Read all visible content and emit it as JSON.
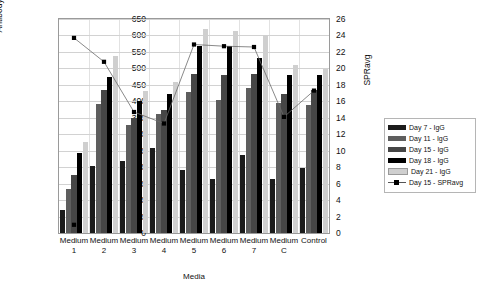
{
  "chart_data": {
    "type": "bar",
    "title": "",
    "xlabel": "Media",
    "ylabel": "Antibody Yield (mg/L)",
    "y2label": "SPRavg",
    "ylim": [
      0,
      650
    ],
    "y2lim": [
      0,
      26
    ],
    "ytick_step": 50,
    "y2tick_step": 2,
    "grid": true,
    "legend_position": "right",
    "categories": [
      "Medium 1",
      "Medium 2",
      "Medium 3",
      "Medium 4",
      "Medium 5",
      "Medium 6",
      "Medium 7",
      "Medium C",
      "Control"
    ],
    "category_lines": [
      [
        "Medium",
        "1"
      ],
      [
        "Medium",
        "2"
      ],
      [
        "Medium",
        "3"
      ],
      [
        "Medium",
        "4"
      ],
      [
        "Medium",
        "5"
      ],
      [
        "Medium",
        "6"
      ],
      [
        "Medium",
        "7"
      ],
      [
        "Medium",
        "C"
      ],
      [
        "Control",
        ""
      ]
    ],
    "yticks": [
      0,
      50,
      100,
      150,
      200,
      250,
      300,
      350,
      400,
      450,
      500,
      550,
      600,
      650
    ],
    "y2ticks": [
      0,
      2,
      4,
      6,
      8,
      10,
      12,
      14,
      16,
      18,
      20,
      22,
      24,
      26
    ],
    "series": [
      {
        "name": "Day 7 - IgG",
        "color": "#1c1c1c",
        "axis": "left",
        "values": [
          70,
          205,
          220,
          257,
          190,
          163,
          236,
          165,
          196
        ]
      },
      {
        "name": "Day 11 - IgG",
        "color": "#5e5e5e",
        "axis": "left",
        "values": [
          135,
          392,
          328,
          360,
          428,
          403,
          441,
          396,
          390
        ]
      },
      {
        "name": "Day 15 - IgG",
        "color": "#464646",
        "axis": "left",
        "values": [
          175,
          434,
          350,
          375,
          482,
          481,
          484,
          421,
          434
        ]
      },
      {
        "name": "Day 18 - IgG",
        "color": "#000000",
        "axis": "left",
        "values": [
          242,
          473,
          400,
          422,
          568,
          567,
          533,
          481,
          479
        ]
      },
      {
        "name": "Day 21 - IgG",
        "color": "#cfcfcf",
        "axis": "left",
        "values": [
          277,
          537,
          430,
          460,
          620,
          615,
          602,
          511,
          499
        ]
      },
      {
        "name": "Day 15 - SPRavg",
        "color": "#000000",
        "axis": "right",
        "marker": "square",
        "line": true,
        "values": [
          23.7,
          20.8,
          14.7,
          13.3,
          22.9,
          22.7,
          22.6,
          14.1,
          17.3
        ]
      }
    ],
    "extra_markers": [
      {
        "series": "Day 15 - SPRavg",
        "category": "Medium 1",
        "value": 1.0
      }
    ],
    "legend_items": [
      {
        "label": "Day 7 - IgG",
        "swatch": "#1c1c1c",
        "kind": "bar"
      },
      {
        "label": "Day 11 - IgG",
        "swatch": "#5e5e5e",
        "kind": "bar"
      },
      {
        "label": "Day 15 - IgG",
        "swatch": "#464646",
        "kind": "bar"
      },
      {
        "label": "Day 18 - IgG",
        "swatch": "#000000",
        "kind": "bar"
      },
      {
        "label": "Day 21 - IgG",
        "swatch": "#cfcfcf",
        "kind": "bar"
      },
      {
        "label": "Day 15 - SPRavg",
        "swatch": "#000000",
        "kind": "marker"
      }
    ]
  }
}
